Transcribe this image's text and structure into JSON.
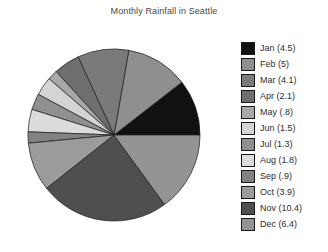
{
  "chart_data": {
    "type": "pie",
    "title": "Monthly Rainfall in Seattle",
    "xlabel": "",
    "ylabel": "",
    "legend_position": "right",
    "grid": false,
    "start_angle_deg": 0,
    "direction": "counterclockwise",
    "total": 38.7,
    "categories": [
      "Jan",
      "Feb",
      "Mar",
      "Apr",
      "May",
      "Jun",
      "Jul",
      "Aug",
      "Sep",
      "Oct",
      "Nov",
      "Dec"
    ],
    "values": [
      4.5,
      5,
      4.1,
      2.1,
      0.8,
      1.5,
      1.3,
      1.8,
      0.9,
      3.9,
      10.4,
      6.4
    ],
    "slices": [
      {
        "label": "Jan (4.5)",
        "name": "Jan",
        "value": 4.5,
        "color": "#111111"
      },
      {
        "label": "Feb (5)",
        "name": "Feb",
        "value": 5,
        "color": "#8f8f8f"
      },
      {
        "label": "Mar (4.1)",
        "name": "Mar",
        "value": 4.1,
        "color": "#7a7a7a"
      },
      {
        "label": "Apr (2.1)",
        "name": "Apr",
        "value": 2.1,
        "color": "#6e6e6e"
      },
      {
        "label": "May (.8)",
        "name": "May",
        "value": 0.8,
        "color": "#a8a8a8"
      },
      {
        "label": "Jun (1.5)",
        "name": "Jun",
        "value": 1.5,
        "color": "#d4d4d4"
      },
      {
        "label": "Jul (1.3)",
        "name": "Jul",
        "value": 1.3,
        "color": "#909090"
      },
      {
        "label": "Aug (1.8)",
        "name": "Aug",
        "value": 1.8,
        "color": "#dcdcdc"
      },
      {
        "label": "Sep (.9)",
        "name": "Sep",
        "value": 0.9,
        "color": "#828282"
      },
      {
        "label": "Oct (3.9)",
        "name": "Oct",
        "value": 3.9,
        "color": "#9b9b9b"
      },
      {
        "label": "Nov (10.4)",
        "name": "Nov",
        "value": 10.4,
        "color": "#4f4f4f"
      },
      {
        "label": "Dec (6.4)",
        "name": "Dec",
        "value": 6.4,
        "color": "#949494"
      }
    ]
  }
}
